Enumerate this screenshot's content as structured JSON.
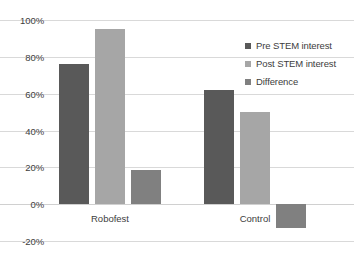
{
  "chart_data": {
    "type": "bar",
    "title": "",
    "subtitle": "",
    "xlabel": "",
    "ylabel": "",
    "categories": [
      "Robofest",
      "Control"
    ],
    "series": [
      {
        "name": "Pre STEM interest",
        "color": "#595959",
        "values": [
          76,
          62
        ]
      },
      {
        "name": "Post STEM interest",
        "color": "#a6a6a6",
        "values": [
          95,
          50
        ]
      },
      {
        "name": "Difference",
        "color": "#808080",
        "values": [
          18.5,
          -13
        ]
      }
    ],
    "ylim": [
      -20,
      100
    ],
    "ytick_labels": [
      "100%",
      "80%",
      "60%",
      "40%",
      "20%",
      "0%",
      "-20%"
    ],
    "ytick_values": [
      100,
      80,
      60,
      40,
      20,
      0,
      -20
    ],
    "grid": true,
    "legend_position": "top-right",
    "value_suffix": "%"
  },
  "axis": {
    "y": {
      "ticks": [
        {
          "label": "100%",
          "value": 100
        },
        {
          "label": "80%",
          "value": 80
        },
        {
          "label": "60%",
          "value": 60
        },
        {
          "label": "40%",
          "value": 40
        },
        {
          "label": "20%",
          "value": 20
        },
        {
          "label": "0%",
          "value": 0
        },
        {
          "label": "-20%",
          "value": -20
        }
      ]
    },
    "x": {
      "ticks": [
        {
          "label": "Robofest"
        },
        {
          "label": "Control"
        }
      ]
    }
  },
  "legend": {
    "entries": [
      {
        "label": "Pre STEM interest",
        "color": "#595959"
      },
      {
        "label": "Post STEM interest",
        "color": "#a6a6a6"
      },
      {
        "label": "Difference",
        "color": "#808080"
      }
    ]
  },
  "colors": {
    "gridline": "#d9d9d9",
    "text": "#3d3d3d",
    "background": "#ffffff"
  }
}
